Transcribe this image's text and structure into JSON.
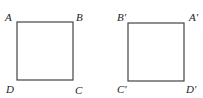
{
  "figure": {
    "squares": [
      {
        "name": "original",
        "vertices": {
          "top_left": "A",
          "top_right": "B",
          "bottom_left": "D",
          "bottom_right": "C"
        }
      },
      {
        "name": "transformed",
        "vertices": {
          "top_left": "B′",
          "top_right": "A′",
          "bottom_left": "C′",
          "bottom_right": "D′"
        }
      }
    ]
  }
}
